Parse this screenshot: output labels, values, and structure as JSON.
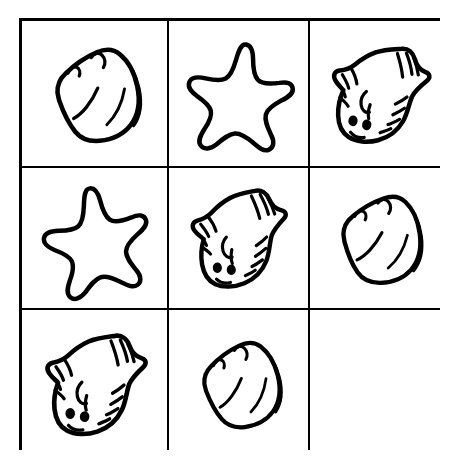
{
  "puzzle": {
    "title": "Matrix Reasoning Puzzle",
    "description": "Three by three grid of sea-creature line drawings with the bottom-right cell left blank.",
    "rows": 3,
    "columns": 3,
    "background_color": "#ffffff",
    "ink_color": "#000000",
    "border_width_px": 3,
    "divider_width_px": 2,
    "cells": [
      {
        "id": "cell-r1c1",
        "row": 1,
        "column": 1,
        "shape": "shell",
        "shape_label": "Shell",
        "icon": "shell-icon",
        "rotation_deg": -12,
        "empty": false
      },
      {
        "id": "cell-r1c2",
        "row": 1,
        "column": 2,
        "shape": "star",
        "shape_label": "Starfish",
        "icon": "starfish-icon",
        "rotation_deg": 8,
        "empty": false
      },
      {
        "id": "cell-r1c3",
        "row": 1,
        "column": 3,
        "shape": "fish",
        "shape_label": "Flatfish",
        "icon": "flatfish-icon",
        "rotation_deg": 6,
        "empty": false
      },
      {
        "id": "cell-r2c1",
        "row": 2,
        "column": 1,
        "shape": "star",
        "shape_label": "Starfish",
        "icon": "starfish-icon",
        "rotation_deg": -6,
        "empty": false
      },
      {
        "id": "cell-r2c2",
        "row": 2,
        "column": 2,
        "shape": "fish",
        "shape_label": "Flatfish",
        "icon": "flatfish-icon",
        "rotation_deg": -2,
        "empty": false
      },
      {
        "id": "cell-r2c3",
        "row": 2,
        "column": 3,
        "shape": "shell",
        "shape_label": "Shell",
        "icon": "shell-icon",
        "rotation_deg": -8,
        "empty": false
      },
      {
        "id": "cell-r3c1",
        "row": 3,
        "column": 1,
        "shape": "fish",
        "shape_label": "Flatfish",
        "icon": "flatfish-icon",
        "rotation_deg": 2,
        "empty": false
      },
      {
        "id": "cell-r3c2",
        "row": 3,
        "column": 2,
        "shape": "shell",
        "shape_label": "Shell",
        "icon": "shell-icon",
        "rotation_deg": -14,
        "empty": false
      },
      {
        "id": "cell-r3c3",
        "row": 3,
        "column": 3,
        "shape": "none",
        "shape_label": "",
        "icon": "blank-cell-icon",
        "rotation_deg": 0,
        "empty": true
      }
    ]
  }
}
